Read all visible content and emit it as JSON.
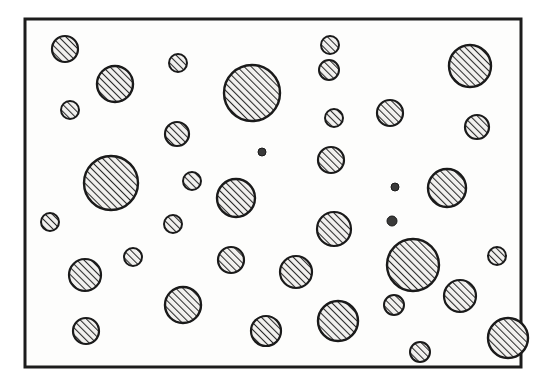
{
  "figure": {
    "kind": "scanned-line-drawing",
    "background_color": "#ffffff",
    "ink_color": "#1a1a1a",
    "fill_tone": "#f2f1ef",
    "hatch_color": "#2b2b2b",
    "frame": {
      "x": 25,
      "y": 19,
      "width": 496,
      "height": 348,
      "stroke_width": 3,
      "stroke_color": "#1c1c1c"
    },
    "hatch": {
      "angle_deg": 45,
      "spacing_px": 5,
      "line_width": 2.1
    },
    "circle_count": 44,
    "circles": [
      {
        "id": "c01",
        "cx": 65,
        "cy": 49,
        "r": 13,
        "size": "small"
      },
      {
        "id": "c02",
        "cx": 178,
        "cy": 63,
        "r": 9,
        "size": "small"
      },
      {
        "id": "c03",
        "cx": 115,
        "cy": 84,
        "r": 18,
        "size": "medium"
      },
      {
        "id": "c04",
        "cx": 252,
        "cy": 93,
        "r": 28,
        "size": "large"
      },
      {
        "id": "c05",
        "cx": 330,
        "cy": 45,
        "r": 9,
        "size": "small"
      },
      {
        "id": "c06",
        "cx": 470,
        "cy": 66,
        "r": 21,
        "size": "medium"
      },
      {
        "id": "c07",
        "cx": 329,
        "cy": 70,
        "r": 10,
        "size": "small"
      },
      {
        "id": "c08",
        "cx": 70,
        "cy": 110,
        "r": 9,
        "size": "small"
      },
      {
        "id": "c09",
        "cx": 334,
        "cy": 118,
        "r": 9,
        "size": "small"
      },
      {
        "id": "c10",
        "cx": 390,
        "cy": 113,
        "r": 13,
        "size": "small"
      },
      {
        "id": "c11",
        "cx": 177,
        "cy": 134,
        "r": 12,
        "size": "small"
      },
      {
        "id": "c12",
        "cx": 477,
        "cy": 127,
        "r": 12,
        "size": "small"
      },
      {
        "id": "c13",
        "cx": 262,
        "cy": 152,
        "r": 4,
        "size": "dot"
      },
      {
        "id": "c14",
        "cx": 111,
        "cy": 183,
        "r": 27,
        "size": "large"
      },
      {
        "id": "c15",
        "cx": 331,
        "cy": 160,
        "r": 13,
        "size": "small"
      },
      {
        "id": "c16",
        "cx": 447,
        "cy": 188,
        "r": 19,
        "size": "medium"
      },
      {
        "id": "c17",
        "cx": 192,
        "cy": 181,
        "r": 9,
        "size": "small"
      },
      {
        "id": "c18",
        "cx": 395,
        "cy": 187,
        "r": 4,
        "size": "dot"
      },
      {
        "id": "c19",
        "cx": 236,
        "cy": 198,
        "r": 19,
        "size": "medium"
      },
      {
        "id": "c20",
        "cx": 50,
        "cy": 222,
        "r": 9,
        "size": "small"
      },
      {
        "id": "c21",
        "cx": 173,
        "cy": 224,
        "r": 9,
        "size": "small"
      },
      {
        "id": "c22",
        "cx": 334,
        "cy": 229,
        "r": 17,
        "size": "medium"
      },
      {
        "id": "c23",
        "cx": 392,
        "cy": 221,
        "r": 5,
        "size": "dot"
      },
      {
        "id": "c24",
        "cx": 133,
        "cy": 257,
        "r": 9,
        "size": "small"
      },
      {
        "id": "c25",
        "cx": 231,
        "cy": 260,
        "r": 13,
        "size": "small"
      },
      {
        "id": "c26",
        "cx": 85,
        "cy": 275,
        "r": 16,
        "size": "medium"
      },
      {
        "id": "c27",
        "cx": 296,
        "cy": 272,
        "r": 16,
        "size": "medium"
      },
      {
        "id": "c28",
        "cx": 413,
        "cy": 265,
        "r": 26,
        "size": "large"
      },
      {
        "id": "c29",
        "cx": 497,
        "cy": 256,
        "r": 9,
        "size": "small"
      },
      {
        "id": "c30",
        "cx": 460,
        "cy": 296,
        "r": 16,
        "size": "medium"
      },
      {
        "id": "c31",
        "cx": 183,
        "cy": 305,
        "r": 18,
        "size": "medium"
      },
      {
        "id": "c32",
        "cx": 394,
        "cy": 305,
        "r": 10,
        "size": "small"
      },
      {
        "id": "c33",
        "cx": 86,
        "cy": 331,
        "r": 13,
        "size": "small"
      },
      {
        "id": "c34",
        "cx": 266,
        "cy": 331,
        "r": 15,
        "size": "medium"
      },
      {
        "id": "c35",
        "cx": 338,
        "cy": 321,
        "r": 20,
        "size": "medium"
      },
      {
        "id": "c36",
        "cx": 420,
        "cy": 352,
        "r": 10,
        "size": "small"
      },
      {
        "id": "c37",
        "cx": 508,
        "cy": 338,
        "r": 20,
        "size": "medium"
      }
    ]
  }
}
